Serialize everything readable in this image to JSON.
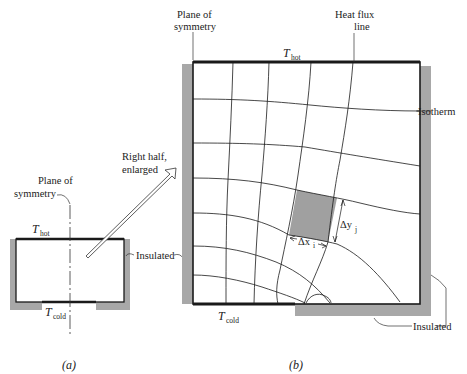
{
  "figure": {
    "panel_a": {
      "caption": "(a)",
      "plane_of_symmetry_line1": "Plane of",
      "plane_of_symmetry_line2": "symmetry",
      "t_hot": {
        "symbol": "T",
        "subscript": "hot"
      },
      "t_cold": {
        "symbol": "T",
        "subscript": "cold"
      },
      "insulated_label": "Insulated",
      "arrow_label_line1": "Right half,",
      "arrow_label_line2": "enlarged"
    },
    "panel_b": {
      "caption": "(b)",
      "plane_of_symmetry_line1": "Plane of",
      "plane_of_symmetry_line2": "symmetry",
      "heat_flux_line1": "Heat flux",
      "heat_flux_line2": "line",
      "isotherm_label": "Isotherm",
      "t_hot": {
        "symbol": "T",
        "subscript": "hot"
      },
      "t_cold": {
        "symbol": "T",
        "subscript": "cold"
      },
      "insulated_label": "Insulated",
      "delta_x": {
        "symbol": "Δx",
        "subscript": "i"
      },
      "delta_y": {
        "symbol": "Δy",
        "subscript": "j"
      }
    },
    "colors": {
      "insulation": "#a8a8a8",
      "shaded_cell": "#a0a0a0",
      "line": "#1a1a1a"
    }
  }
}
